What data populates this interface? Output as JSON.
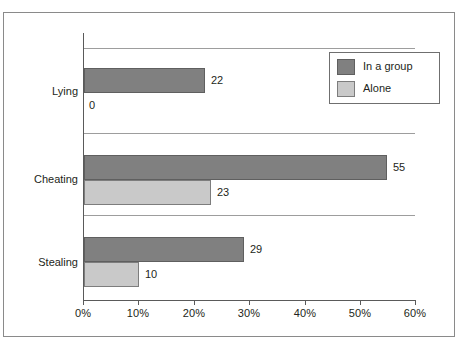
{
  "chart_data": {
    "type": "bar",
    "orientation": "horizontal",
    "title": "",
    "subtitle": "",
    "xlabel": "",
    "ylabel": "",
    "categories": [
      "Lying",
      "Cheating",
      "Stealing"
    ],
    "series": [
      {
        "name": "In a group",
        "color": "#808080",
        "values": [
          22,
          55,
          29
        ]
      },
      {
        "name": "Alone",
        "color": "#c9c9c9",
        "values": [
          0,
          23,
          10
        ]
      }
    ],
    "value_labels": {
      "Lying": {
        "In a group": "22",
        "Alone": "0"
      },
      "Cheating": {
        "In a group": "55",
        "Alone": "23"
      },
      "Stealing": {
        "In a group": "29",
        "Alone": "10"
      }
    },
    "xlim": [
      0,
      60
    ],
    "xticks": [
      0,
      10,
      20,
      30,
      40,
      50,
      60
    ],
    "xtick_labels": [
      "0%",
      "10%",
      "20%",
      "30%",
      "40%",
      "50%",
      "60%"
    ],
    "grid": "horizontal-category-separators",
    "legend_position": "top-right",
    "frame": true
  },
  "axis": {
    "ticks": [
      {
        "label": "0%",
        "value": 0
      },
      {
        "label": "10%",
        "value": 10
      },
      {
        "label": "20%",
        "value": 20
      },
      {
        "label": "30%",
        "value": 30
      },
      {
        "label": "40%",
        "value": 40
      },
      {
        "label": "50%",
        "value": 50
      },
      {
        "label": "60%",
        "value": 60
      }
    ]
  },
  "categories": [
    {
      "label": "Lying"
    },
    {
      "label": "Cheating"
    },
    {
      "label": "Stealing"
    }
  ],
  "legend": {
    "items": [
      {
        "label": "In a group",
        "color": "#808080"
      },
      {
        "label": "Alone",
        "color": "#c9c9c9"
      }
    ]
  },
  "bars": [
    {
      "category": "Lying",
      "series": "In a group",
      "value": 22,
      "label": "22"
    },
    {
      "category": "Lying",
      "series": "Alone",
      "value": 0,
      "label": "0"
    },
    {
      "category": "Cheating",
      "series": "In a group",
      "value": 55,
      "label": "55"
    },
    {
      "category": "Cheating",
      "series": "Alone",
      "value": 23,
      "label": "23"
    },
    {
      "category": "Stealing",
      "series": "In a group",
      "value": 29,
      "label": "29"
    },
    {
      "category": "Stealing",
      "series": "Alone",
      "value": 10,
      "label": "10"
    }
  ],
  "colors": {
    "in_a_group": "#808080",
    "alone": "#c9c9c9",
    "axis": "#5a5a5a",
    "grid": "#9d9d9d",
    "text": "#231f20",
    "frame": "#8a8a8a",
    "background": "#ffffff"
  }
}
